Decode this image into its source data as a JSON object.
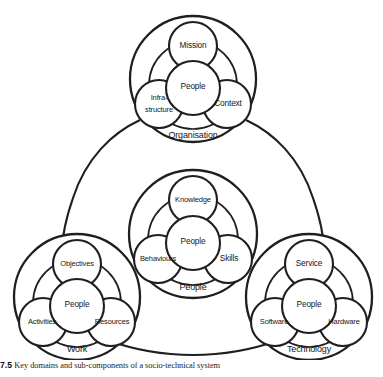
{
  "figure": {
    "caption_number": "7.5",
    "caption_text": "Key domains and sub-components of a socio-technical system",
    "line_color": "#1f1f1f",
    "fill_color": "#ffffff",
    "text_color": "#161616"
  },
  "diagram": {
    "type": "venn-cluster-diagram",
    "layout": "triangular",
    "clusters": [
      {
        "id": "organisation",
        "domain_label": "Organisation",
        "position": "top",
        "core": "People",
        "satellites": [
          "Mission",
          "Infra-structure",
          "Context"
        ],
        "satellite_top": "Mission",
        "satellite_left_line1": "Infra-",
        "satellite_left_line2": "structure",
        "satellite_right": "Context"
      },
      {
        "id": "people",
        "domain_label": "People",
        "position": "center",
        "core": "People",
        "satellites": [
          "Knowledge",
          "Behaviours",
          "Skills"
        ],
        "satellite_top": "Knowledge",
        "satellite_left": "Behaviours",
        "satellite_right": "Skills"
      },
      {
        "id": "work",
        "domain_label": "Work",
        "position": "bottom-left",
        "core": "People",
        "satellites": [
          "Objectives",
          "Activities",
          "Resources"
        ],
        "satellite_top": "Objectives",
        "satellite_left": "Activities",
        "satellite_right": "Resources"
      },
      {
        "id": "technology",
        "domain_label": "Technology",
        "position": "bottom-right",
        "core": "People",
        "satellites": [
          "Service",
          "Software",
          "Hardware"
        ],
        "satellite_top": "Service",
        "satellite_left": "Software",
        "satellite_right": "Hardware"
      }
    ]
  }
}
